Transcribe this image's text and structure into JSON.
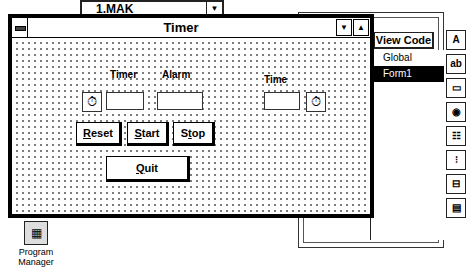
{
  "project_window": {
    "title": "1.MAK",
    "view_code_label": "View Code",
    "items": [
      {
        "label": "Global",
        "selected": false
      },
      {
        "label": "Form1",
        "selected": true
      }
    ]
  },
  "toolbox": {
    "tools": [
      {
        "name": "label-tool-icon",
        "glyph": "A"
      },
      {
        "name": "textbox-tool-icon",
        "glyph": "ab"
      },
      {
        "name": "command-button-tool-icon",
        "glyph": "▭"
      },
      {
        "name": "option-button-tool-icon",
        "glyph": "◉"
      },
      {
        "name": "list-box-tool-icon",
        "glyph": "☷"
      },
      {
        "name": "vscroll-tool-icon",
        "glyph": "⁝"
      },
      {
        "name": "hscroll-tool-icon",
        "glyph": "⊟"
      },
      {
        "name": "file-list-tool-icon",
        "glyph": "▤"
      }
    ]
  },
  "form": {
    "title": "Timer",
    "min_glyph": "▼",
    "max_glyph": "▲",
    "labels": {
      "timer": "Timer",
      "alarm": "Alarm",
      "time": "Time"
    },
    "timer_glyph": "⏱",
    "buttons": {
      "reset": {
        "accel": "R",
        "rest": "eset"
      },
      "start": {
        "accel": "S",
        "rest": "tart"
      },
      "stop": {
        "pre": "S",
        "accel": "t",
        "rest": "op"
      },
      "quit": {
        "accel": "Q",
        "rest": "uit"
      }
    }
  },
  "desktop": {
    "program_manager_label": "Program Manager",
    "program_manager_glyph": "▦"
  }
}
